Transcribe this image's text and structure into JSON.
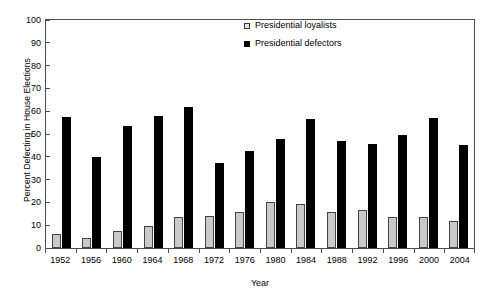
{
  "chart_data": {
    "type": "bar",
    "title": "",
    "xlabel": "Year",
    "ylabel": "Percent Defecting in House Elections",
    "ylim": [
      0,
      100
    ],
    "ytick_step": 10,
    "yticks": [
      100,
      90,
      80,
      70,
      60,
      50,
      40,
      30,
      20,
      10,
      0
    ],
    "grid": false,
    "legend_position": "top-center-right",
    "categories": [
      "1952",
      "1956",
      "1960",
      "1964",
      "1968",
      "1972",
      "1976",
      "1980",
      "1984",
      "1988",
      "1992",
      "1996",
      "2000",
      "2004"
    ],
    "series": [
      {
        "name": "Presidential loyalists",
        "color": "#c9c9c9",
        "values": [
          6,
          4.5,
          7.5,
          9.5,
          13.5,
          14,
          16,
          20,
          19.5,
          16,
          16.5,
          13.5,
          13.5,
          12
        ]
      },
      {
        "name": "Presidential defectors",
        "color": "#000000",
        "values": [
          57.5,
          40,
          53.5,
          58,
          62,
          37.5,
          42.5,
          48,
          56.5,
          47,
          45.5,
          49.5,
          57,
          45
        ]
      }
    ]
  }
}
